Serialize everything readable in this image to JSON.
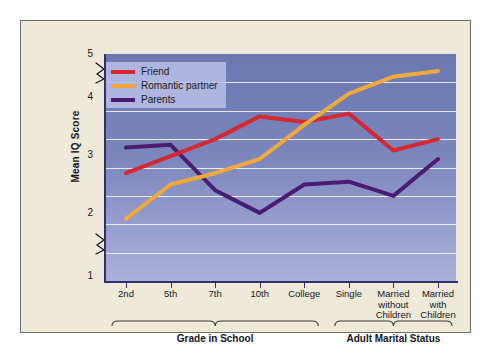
{
  "chart_data": {
    "type": "line",
    "title": "",
    "xlabel": "",
    "ylabel": "Mean IQ Score",
    "ylim": [
      1,
      5
    ],
    "yticks": [
      1,
      2,
      3,
      4,
      5
    ],
    "ytick_labels": [
      "1",
      "2",
      "3",
      "4",
      "5"
    ],
    "gridlines": [
      1.5,
      2.0,
      2.5,
      3.0,
      3.5,
      4.0,
      4.5
    ],
    "grid": true,
    "axis_breaks": [
      "between 1 and 2",
      "between 4 and 5"
    ],
    "legend_position": "upper left inside plot",
    "categories": [
      "2nd",
      "5th",
      "7th",
      "10th",
      "College",
      "Single",
      "Married without Children",
      "Married with Children"
    ],
    "series": [
      {
        "name": "Friend",
        "color": "#D5272F",
        "values": [
          2.9,
          3.2,
          3.5,
          3.9,
          3.8,
          3.95,
          3.3,
          3.5
        ]
      },
      {
        "name": "Romantic partner",
        "color": "#F0A93A",
        "values": [
          2.1,
          2.7,
          2.9,
          3.15,
          3.75,
          4.3,
          4.6,
          4.7
        ]
      },
      {
        "name": "Parents",
        "color": "#4B1B72",
        "values": [
          3.35,
          3.4,
          2.6,
          2.2,
          2.7,
          2.75,
          2.5,
          3.15
        ]
      }
    ],
    "group_brackets": [
      {
        "label": "Grade in School",
        "from": "2nd",
        "to": "College"
      },
      {
        "label": "Adult Marital Status",
        "from": "Single",
        "to": "Married with Children"
      }
    ]
  },
  "legend": {
    "items": [
      {
        "label": "Friend",
        "color": "#D5272F"
      },
      {
        "label": "Romantic partner",
        "color": "#F0A93A"
      },
      {
        "label": "Parents",
        "color": "#4B1B72"
      }
    ]
  },
  "axes": {
    "y_title": "Mean IQ Score",
    "y_tick_5": "5",
    "y_tick_4": "4",
    "y_tick_3": "3",
    "y_tick_2": "2",
    "y_tick_1": "1",
    "x_tick_0": "2nd",
    "x_tick_1": "5th",
    "x_tick_2": "7th",
    "x_tick_3": "10th",
    "x_tick_4": "College",
    "x_tick_5": "Single",
    "x_tick_6": "Married\nwithout\nChildren",
    "x_tick_7": "Married\nwith\nChildren"
  },
  "groups": {
    "grade_label": "Grade in School",
    "marital_label": "Adult Marital Status"
  },
  "colors": {
    "friend": "#D5272F",
    "romantic": "#F0A93A",
    "parents": "#4B1B72",
    "plot_bg_top": "#6A77B0",
    "plot_bg_bottom": "#AAB0D8",
    "card_bg": "#EFE9DA",
    "axis": "#2E2F6B"
  }
}
